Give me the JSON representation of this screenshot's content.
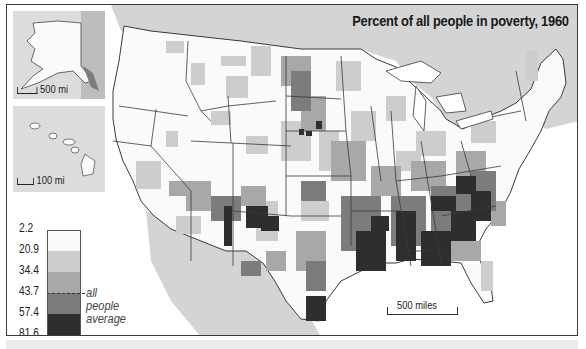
{
  "title": "Percent of all people in poverty, 1960",
  "insets": {
    "alaska": {
      "scale_label": "500 mi"
    },
    "hawaii": {
      "scale_label": "100 mi"
    }
  },
  "scale_bar": {
    "label": "500 miles"
  },
  "legend": {
    "breaks": [
      "2.2",
      "20.9",
      "34.4",
      "43.7",
      "57.4",
      "81.6"
    ],
    "classes": [
      {
        "range": "2.2–20.9",
        "color": "#fafafa"
      },
      {
        "range": "20.9–34.4",
        "color": "#cdcdcd"
      },
      {
        "range": "34.4–43.7",
        "color": "#a8a8a8"
      },
      {
        "range": "43.7–57.4",
        "color": "#7c7c7c"
      },
      {
        "range": "57.4–81.6",
        "color": "#2e2e2e"
      }
    ],
    "average_marker": {
      "value": "43.7",
      "label_line1": "all people",
      "label_line2": "average"
    }
  },
  "colors": {
    "ocean": "#ffffff",
    "neighbor_land": "#d4d4d4",
    "state_border": "#3a3a3a",
    "frame_border": "#3a3a3a"
  }
}
